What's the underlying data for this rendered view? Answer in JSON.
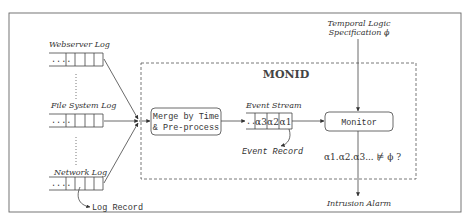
{
  "diagram": {
    "title": "MONID",
    "logs": [
      {
        "label": "Webserver Log"
      },
      {
        "label": "File System Log"
      },
      {
        "label": "Network Log"
      }
    ],
    "log_record_label": "Log Record",
    "log_dots": "....",
    "merge_box": {
      "line1": "Merge by Time",
      "line2": "& Pre-process"
    },
    "event_stream": {
      "label": "Event Stream",
      "dots": "...",
      "cells": [
        "α3",
        "α2",
        "α1"
      ]
    },
    "event_record_label": "Event Record",
    "monitor_label": "Monitor",
    "spec": {
      "line1": "Temporal Logic",
      "line2": "Specification ϕ"
    },
    "query": "α1.α2.α3... ⊭ ϕ ?",
    "output_label": "Intrusion Alarm"
  }
}
